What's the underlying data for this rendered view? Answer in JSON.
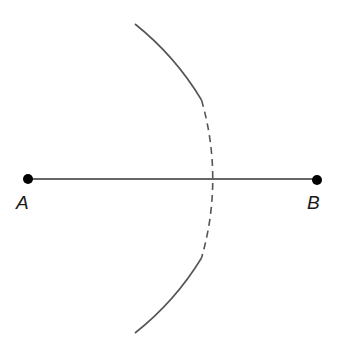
{
  "diagram": {
    "points": [
      {
        "label": "A",
        "x": 28,
        "y": 179
      },
      {
        "label": "B",
        "x": 317,
        "y": 179
      }
    ],
    "segment": {
      "from": "A",
      "to": "B"
    },
    "arc": {
      "top": [
        135,
        24
      ],
      "bottom": [
        135,
        333
      ],
      "crossing": [
        221,
        179
      ],
      "dashed_range_y": [
        100,
        258
      ]
    },
    "colors": {
      "line": "#333333",
      "arc": "#555555",
      "point": "#000000"
    }
  }
}
